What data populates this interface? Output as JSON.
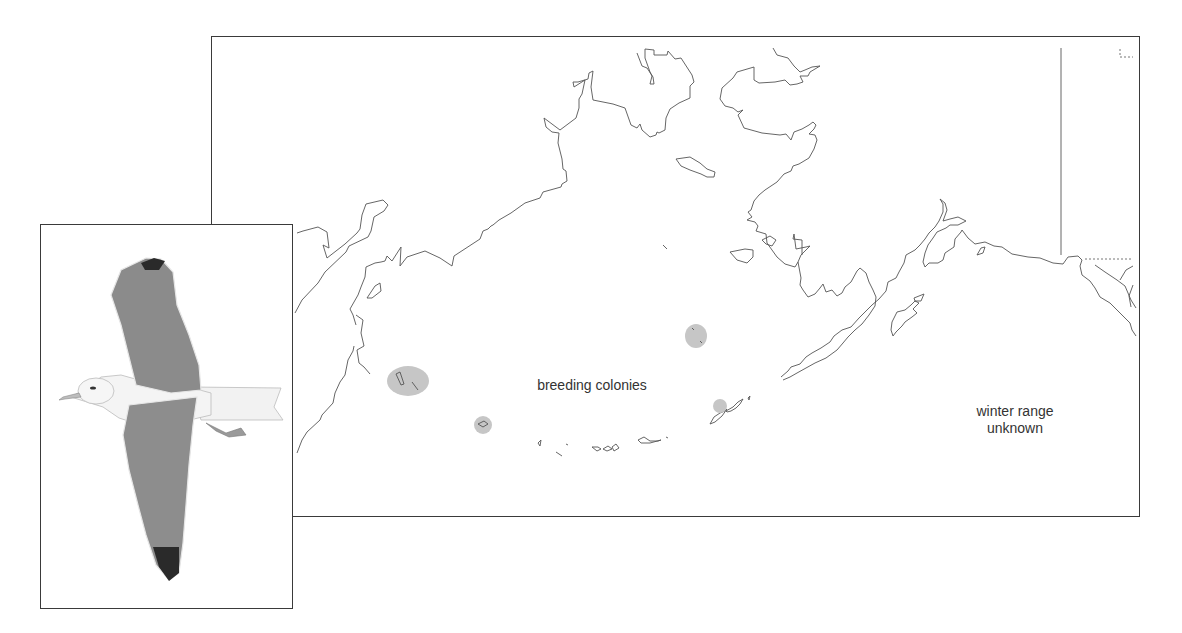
{
  "map": {
    "labels": {
      "breeding": "breeding colonies",
      "winter_line1": "winter range",
      "winter_line2": "unknown"
    },
    "legend_colors": {
      "breeding_colony_fill": "#c6c6c6",
      "coastline": "#555555",
      "frame": "#3a3a3a"
    },
    "colonies": [
      {
        "name": "Commander Islands",
        "cx": 408,
        "cy": 382
      },
      {
        "name": "Near Islands",
        "cx": 483,
        "cy": 425
      },
      {
        "name": "Pribilof Islands",
        "cx": 696,
        "cy": 336
      },
      {
        "name": "Bogoslof Island",
        "cx": 720,
        "cy": 406
      }
    ]
  },
  "inset": {
    "subject": "gull in flight (dorsal view)"
  }
}
